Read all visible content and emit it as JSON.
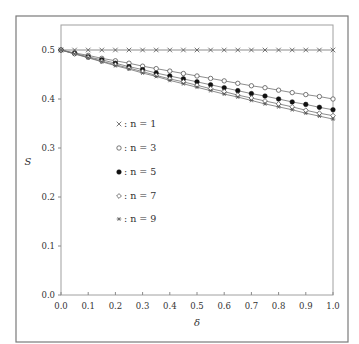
{
  "chart_data": {
    "type": "line",
    "title": "",
    "xlabel": "δ",
    "ylabel": "S",
    "xlim": [
      0.0,
      1.0
    ],
    "ylim": [
      0.0,
      0.5
    ],
    "grid": false,
    "legend_position": "center-left",
    "x_ticks": [
      "0.0",
      "0.1",
      "0.2",
      "0.3",
      "0.4",
      "0.5",
      "0.6",
      "0.7",
      "0.8",
      "0.9",
      "1.0"
    ],
    "y_ticks": [
      "0.0",
      "0.1",
      "0.2",
      "0.3",
      "0.4",
      "0.5"
    ],
    "x": [
      0.0,
      0.05,
      0.1,
      0.15,
      0.2,
      0.25,
      0.3,
      0.35,
      0.4,
      0.45,
      0.5,
      0.55,
      0.6,
      0.65,
      0.7,
      0.75,
      0.8,
      0.85,
      0.9,
      0.95,
      1.0
    ],
    "series": [
      {
        "name": "n = 1",
        "legend_label": "× : n = 1",
        "marker": "cross",
        "values": [
          0.5,
          0.5,
          0.5,
          0.5,
          0.5,
          0.5,
          0.5,
          0.5,
          0.5,
          0.5,
          0.5,
          0.5,
          0.5,
          0.5,
          0.5,
          0.5,
          0.5,
          0.5,
          0.5,
          0.5,
          0.5
        ]
      },
      {
        "name": "n = 3",
        "legend_label": "○ : n = 3",
        "marker": "open-circle",
        "values": [
          0.5,
          0.494,
          0.489,
          0.483,
          0.478,
          0.473,
          0.467,
          0.462,
          0.457,
          0.452,
          0.447,
          0.442,
          0.437,
          0.432,
          0.427,
          0.423,
          0.418,
          0.413,
          0.409,
          0.405,
          0.4
        ]
      },
      {
        "name": "n = 5",
        "legend_label": "● : n = 5",
        "marker": "filled-circle",
        "values": [
          0.5,
          0.493,
          0.486,
          0.48,
          0.473,
          0.466,
          0.46,
          0.453,
          0.447,
          0.441,
          0.435,
          0.429,
          0.423,
          0.417,
          0.411,
          0.406,
          0.4,
          0.394,
          0.389,
          0.383,
          0.378
        ]
      },
      {
        "name": "n = 7",
        "legend_label": "◇ : n = 7",
        "marker": "open-diamond",
        "values": [
          0.5,
          0.492,
          0.485,
          0.477,
          0.47,
          0.463,
          0.456,
          0.448,
          0.441,
          0.435,
          0.428,
          0.421,
          0.415,
          0.408,
          0.402,
          0.396,
          0.39,
          0.384,
          0.377,
          0.371,
          0.366
        ]
      },
      {
        "name": "n = 9",
        "legend_label": "∗ : n = 9",
        "marker": "asterisk",
        "values": [
          0.5,
          0.492,
          0.484,
          0.476,
          0.468,
          0.461,
          0.453,
          0.446,
          0.438,
          0.431,
          0.424,
          0.417,
          0.41,
          0.404,
          0.397,
          0.39,
          0.384,
          0.378,
          0.371,
          0.365,
          0.359
        ]
      }
    ]
  },
  "legend": {
    "items": [
      {
        "symbol": "×",
        "text": ": n = 1"
      },
      {
        "symbol": "○",
        "text": ": n = 3"
      },
      {
        "symbol": "●",
        "text": ": n = 5"
      },
      {
        "symbol": "◇",
        "text": ": n = 7"
      },
      {
        "symbol": "∗",
        "text": ": n = 9"
      }
    ]
  },
  "colors": {
    "frame": "#7a7a7a",
    "axis": "#8a8a8a",
    "line": "#707070",
    "marker": "#555555",
    "marker_fill_dark": "#111111"
  }
}
